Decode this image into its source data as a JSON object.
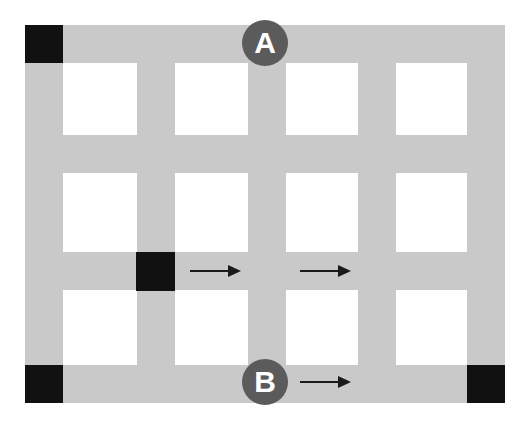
{
  "diagram": {
    "canvas": {
      "width": 523,
      "height": 426,
      "background": "#ffffff"
    },
    "colors": {
      "road": "#c9c9c9",
      "block": "#111111",
      "marker_fill": "#5b5b5b",
      "marker_text": "#ffffff",
      "arrow": "#1a1a1a",
      "background": "#ffffff"
    },
    "roads": {
      "vertical": [
        {
          "name": "vertical-road-1",
          "x": 25,
          "y": 25,
          "width": 38,
          "height": 378
        },
        {
          "name": "vertical-road-2",
          "x": 137,
          "y": 25,
          "width": 38,
          "height": 378
        },
        {
          "name": "vertical-road-3",
          "x": 248,
          "y": 25,
          "width": 38,
          "height": 378
        },
        {
          "name": "vertical-road-4",
          "x": 358,
          "y": 25,
          "width": 38,
          "height": 378
        },
        {
          "name": "vertical-road-5",
          "x": 467,
          "y": 25,
          "width": 38,
          "height": 378
        }
      ],
      "horizontal": [
        {
          "name": "horizontal-road-1",
          "x": 25,
          "y": 25,
          "width": 480,
          "height": 38
        },
        {
          "name": "horizontal-road-2",
          "x": 25,
          "y": 135,
          "width": 480,
          "height": 38
        },
        {
          "name": "horizontal-road-3",
          "x": 25,
          "y": 252,
          "width": 480,
          "height": 38
        },
        {
          "name": "horizontal-road-4",
          "x": 25,
          "y": 365,
          "width": 480,
          "height": 38
        }
      ]
    },
    "blocks": [
      {
        "name": "block-top-left",
        "x": 25,
        "y": 25,
        "width": 38,
        "height": 38
      },
      {
        "name": "block-center-left",
        "x": 136,
        "y": 252,
        "width": 39,
        "height": 39
      },
      {
        "name": "block-bottom-left",
        "x": 25,
        "y": 365,
        "width": 38,
        "height": 38
      },
      {
        "name": "block-bottom-right",
        "x": 467,
        "y": 365,
        "width": 38,
        "height": 38
      }
    ],
    "markers": [
      {
        "name": "marker-a",
        "label": "A",
        "cx": 265,
        "cy": 43,
        "diameter": 46,
        "font_size": 30
      },
      {
        "name": "marker-b",
        "label": "B",
        "cx": 265,
        "cy": 382,
        "diameter": 46,
        "font_size": 30
      }
    ],
    "arrows": [
      {
        "name": "arrow-1",
        "x1": 190,
        "y1": 271,
        "x2": 241,
        "y2": 271,
        "direction": "right"
      },
      {
        "name": "arrow-2",
        "x1": 300,
        "y1": 271,
        "x2": 351,
        "y2": 271,
        "direction": "right"
      },
      {
        "name": "arrow-3",
        "x1": 300,
        "y1": 382,
        "x2": 351,
        "y2": 382,
        "direction": "right"
      }
    ]
  }
}
